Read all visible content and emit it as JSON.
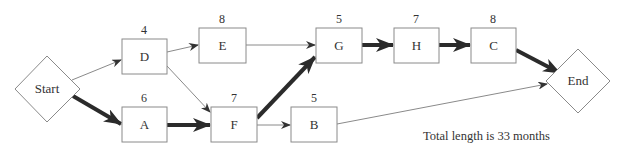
{
  "diagram": {
    "type": "critical-path-network",
    "colors": {
      "stroke": "#8a8a8a",
      "critical": "#2b2b2b",
      "text": "#333333",
      "background": "#ffffff"
    },
    "start": {
      "label": "Start"
    },
    "end": {
      "label": "End"
    },
    "tasks": [
      {
        "id": "D",
        "label": "D",
        "duration": "4"
      },
      {
        "id": "E",
        "label": "E",
        "duration": "8"
      },
      {
        "id": "A",
        "label": "A",
        "duration": "6"
      },
      {
        "id": "F",
        "label": "F",
        "duration": "7"
      },
      {
        "id": "B",
        "label": "B",
        "duration": "5"
      },
      {
        "id": "G",
        "label": "G",
        "duration": "5"
      },
      {
        "id": "H",
        "label": "H",
        "duration": "7"
      },
      {
        "id": "C",
        "label": "C",
        "duration": "8"
      }
    ],
    "edges": [
      {
        "from": "Start",
        "to": "D",
        "critical": false
      },
      {
        "from": "Start",
        "to": "A",
        "critical": true
      },
      {
        "from": "D",
        "to": "E",
        "critical": false
      },
      {
        "from": "D",
        "to": "F",
        "critical": false
      },
      {
        "from": "A",
        "to": "F",
        "critical": true
      },
      {
        "from": "E",
        "to": "G",
        "critical": false
      },
      {
        "from": "F",
        "to": "G",
        "critical": true
      },
      {
        "from": "F",
        "to": "B",
        "critical": false
      },
      {
        "from": "G",
        "to": "H",
        "critical": true
      },
      {
        "from": "H",
        "to": "C",
        "critical": true
      },
      {
        "from": "C",
        "to": "End",
        "critical": true
      },
      {
        "from": "B",
        "to": "End",
        "critical": false
      }
    ],
    "note": "Total length is 33 months"
  }
}
